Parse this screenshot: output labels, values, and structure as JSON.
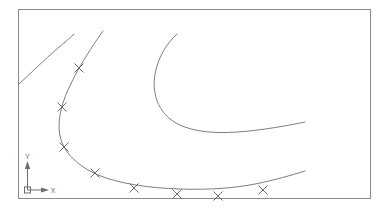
{
  "view": {
    "title": "CAD Curve View",
    "background_color": "#ffffff",
    "width": 387,
    "height": 216
  },
  "viewport_frame": {
    "name": "drawing-border",
    "stroke_color": "#8a8a8a",
    "x": 18,
    "y": 9,
    "width": 352,
    "height": 189
  },
  "ucs_icon": {
    "label": "UCS icon",
    "origin_x": 27,
    "origin_y": 190,
    "x_axis_label": "X",
    "y_axis_label": "Y",
    "stroke_color": "#6d6d6d",
    "x_axis_length": 22,
    "y_axis_length": 28
  },
  "geometry": {
    "stroke_color": "#6f6f6f",
    "marker_color": "#5a5a5a",
    "marker_glyph": "x-marker",
    "marker_size": 4.5,
    "curves": [
      {
        "name": "upper-left-arc",
        "id": "curve-1",
        "has_markers": false,
        "path": "M 19,84 C 30,74 44,60 58,48 C 64,43 70,38 74,34"
      },
      {
        "name": "main-spline-upper",
        "id": "curve-2",
        "has_markers": true,
        "path": "M 103,31 C 95,42 86,56 78,70 C 70,85 64,97 61,110 C 58,123 58,136 64,147"
      },
      {
        "name": "main-spline-lower",
        "id": "curve-3",
        "has_markers": true,
        "path": "M 64,147 C 70,158 82,168 98,175 C 120,184 150,188 180,189 C 210,190 235,188 255,184 C 275,180 292,175 305,171"
      },
      {
        "name": "inner-offset-arc",
        "id": "curve-4",
        "has_markers": false,
        "path": "M 177,34 C 166,44 158,58 155,74 C 152,92 157,108 170,119 C 185,131 210,134 238,132 C 265,130 290,125 305,122"
      }
    ],
    "markers": [
      {
        "name": "point-marker-1",
        "x": 79,
        "y": 68
      },
      {
        "name": "point-marker-2",
        "x": 62,
        "y": 107
      },
      {
        "name": "point-marker-3",
        "x": 64,
        "y": 147
      },
      {
        "name": "point-marker-4",
        "x": 95,
        "y": 173
      },
      {
        "name": "point-marker-5",
        "x": 134,
        "y": 188
      },
      {
        "name": "point-marker-6",
        "x": 177,
        "y": 194
      },
      {
        "name": "point-marker-7",
        "x": 218,
        "y": 196
      },
      {
        "name": "point-marker-8",
        "x": 263,
        "y": 190
      }
    ]
  }
}
